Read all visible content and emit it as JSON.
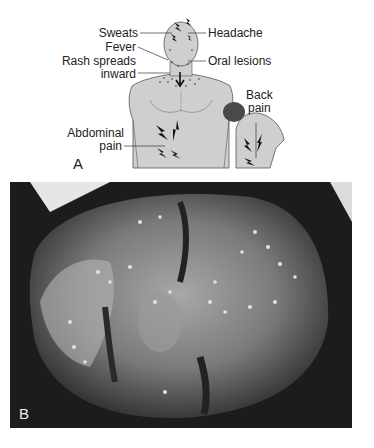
{
  "figure": {
    "panel_a": {
      "letter": "A",
      "labels": {
        "sweats": "Sweats",
        "headache": "Headache",
        "fever": "Fever",
        "oral_lesions": "Oral lesions",
        "rash_line1": "Rash spreads",
        "rash_line2": "inward",
        "back_line1": "Back",
        "back_line2": "pain",
        "abdominal_line1": "Abdominal",
        "abdominal_line2": "pain"
      }
    },
    "panel_b": {
      "letter": "B"
    },
    "colors": {
      "skin_gray": "#c9c9c9",
      "outline": "#555555",
      "hair": "#4a4a4a",
      "photo_dark": "#1e1e1e",
      "photo_skin": "#8a8a8a"
    }
  }
}
